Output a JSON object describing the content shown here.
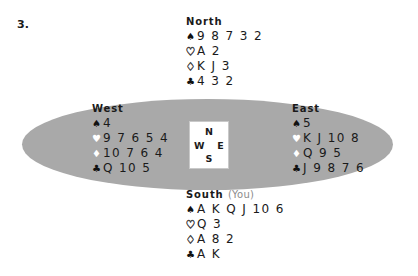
{
  "problem": {
    "number": "3."
  },
  "compass": {
    "north": "N",
    "west": "W",
    "east": "E",
    "south": "S"
  },
  "suits": {
    "spade": "♠",
    "heart": "♥",
    "heart_outline": "♡",
    "diamond": "♦",
    "diamond_outline": "♢",
    "club": "♣"
  },
  "hands": {
    "north": {
      "label": "North",
      "you_note": "",
      "spades": "9 8 7 3 2",
      "hearts": "A 2",
      "diamonds": "K J 3",
      "clubs": "4 3 2"
    },
    "west": {
      "label": "West",
      "you_note": "",
      "spades": "4",
      "hearts": "9 7 6 5 4",
      "diamonds": "10 7 6 4",
      "clubs": "Q 10 5"
    },
    "east": {
      "label": "East",
      "you_note": "",
      "spades": "5",
      "hearts": "K J 10 8",
      "diamonds": "Q 9 5",
      "clubs": "J 9 8 7 6"
    },
    "south": {
      "label": "South",
      "you_note": "(You)",
      "spades": "A K Q J 10 6",
      "hearts": "Q 3",
      "diamonds": "A 8 2",
      "clubs": "A K"
    }
  },
  "colors": {
    "table_felt": "#a9a9a9",
    "page_background": "#ffffff",
    "text": "#1a1a1a",
    "muted_text": "#8c8c8c"
  }
}
